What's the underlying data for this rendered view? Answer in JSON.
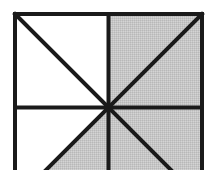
{
  "diagram": {
    "colors": {
      "background": "#ffffff",
      "line": "#1a1a1a",
      "shaded": "#c6c6c6",
      "unshaded": "#ffffff"
    },
    "square": {
      "left": 15,
      "top": 14,
      "size": 187
    },
    "line_width": 4,
    "regions": [
      {
        "id": "top-left-upper",
        "quadrant": "top-left",
        "shaded": false
      },
      {
        "id": "top-left-lower",
        "quadrant": "top-left",
        "shaded": false
      },
      {
        "id": "top-right-upper",
        "quadrant": "top-right",
        "shaded": true
      },
      {
        "id": "top-right-lower",
        "quadrant": "top-right",
        "shaded": true
      },
      {
        "id": "bottom-left-outer",
        "quadrant": "bottom-left",
        "shaded": false
      },
      {
        "id": "bottom-left-inner",
        "quadrant": "bottom-left",
        "shaded": true
      },
      {
        "id": "bottom-right-inner",
        "quadrant": "bottom-right",
        "shaded": true
      },
      {
        "id": "bottom-right-outer",
        "quadrant": "bottom-right",
        "shaded": true
      }
    ],
    "shaded_count": 5,
    "total_count": 8
  }
}
